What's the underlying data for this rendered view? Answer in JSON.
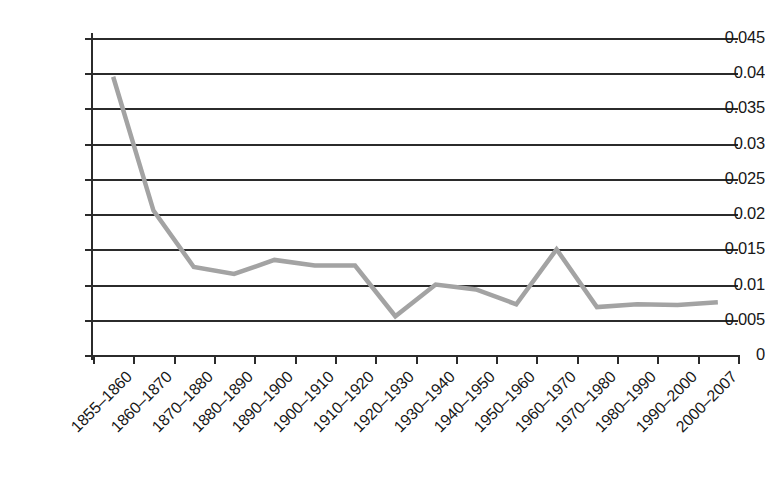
{
  "chart_data": {
    "type": "line",
    "title": "",
    "subtitle": "",
    "xlabel": "",
    "ylabel": "",
    "categories": [
      "1855–1860",
      "1860–1870",
      "1870–1880",
      "1880–1890",
      "1890–1900",
      "1900–1910",
      "1910–1920",
      "1920–1930",
      "1930–1940",
      "1940–1950",
      "1950–1960",
      "1960–1970",
      "1970–1980",
      "1980–1990",
      "1990–2000",
      "2000–2007"
    ],
    "values": [
      0.0395,
      0.0205,
      0.0125,
      0.0115,
      0.0135,
      0.0127,
      0.0127,
      0.0055,
      0.01,
      0.0093,
      0.0072,
      0.015,
      0.0068,
      0.0072,
      0.0071,
      0.0075
    ],
    "ylim": [
      0,
      0.045
    ],
    "ytick_labels": [
      "0.045",
      "0.04",
      "0.035",
      "0.03",
      "0.025",
      "0.02",
      "0.015",
      "0.01",
      "0.005",
      "0"
    ],
    "ytick_values": [
      0.045,
      0.04,
      0.035,
      0.03,
      0.025,
      0.02,
      0.015,
      0.01,
      0.005,
      0
    ],
    "grid": "horizontal",
    "legend": "none",
    "series_color": "#a3a3a3",
    "axis_color": "#2b2b2b",
    "background_color": "#ffffff"
  }
}
